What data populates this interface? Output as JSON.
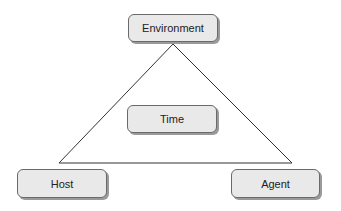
{
  "diagram": {
    "nodes": [
      {
        "id": "environment",
        "label": "Environment"
      },
      {
        "id": "time",
        "label": "Time"
      },
      {
        "id": "host",
        "label": "Host"
      },
      {
        "id": "agent",
        "label": "Agent"
      }
    ],
    "edges": [
      {
        "from": "environment",
        "to": "host"
      },
      {
        "from": "environment",
        "to": "agent"
      },
      {
        "from": "host",
        "to": "agent"
      }
    ],
    "colors": {
      "node_fill": "#e9e9e9",
      "node_border": "#6a6a6a",
      "line": "#333333"
    }
  }
}
